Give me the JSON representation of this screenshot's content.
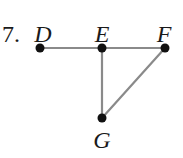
{
  "problem_number": "7.",
  "graph": {
    "vertices": [
      {
        "id": "D",
        "label": "D",
        "x": 40,
        "y": 48,
        "label_x": 43,
        "label_y": 22
      },
      {
        "id": "E",
        "label": "E",
        "x": 102,
        "y": 48,
        "label_x": 102,
        "label_y": 22
      },
      {
        "id": "F",
        "label": "F",
        "x": 165,
        "y": 48,
        "label_x": 164,
        "label_y": 22
      },
      {
        "id": "G",
        "label": "G",
        "x": 102,
        "y": 118,
        "label_x": 102,
        "label_y": 128
      }
    ],
    "edges": [
      {
        "from": "D",
        "to": "E"
      },
      {
        "from": "E",
        "to": "F"
      },
      {
        "from": "E",
        "to": "G"
      },
      {
        "from": "F",
        "to": "G"
      }
    ]
  },
  "colors": {
    "edge": "#8a8a8a",
    "vertex": "#111111",
    "text": "#1a1a1a"
  }
}
